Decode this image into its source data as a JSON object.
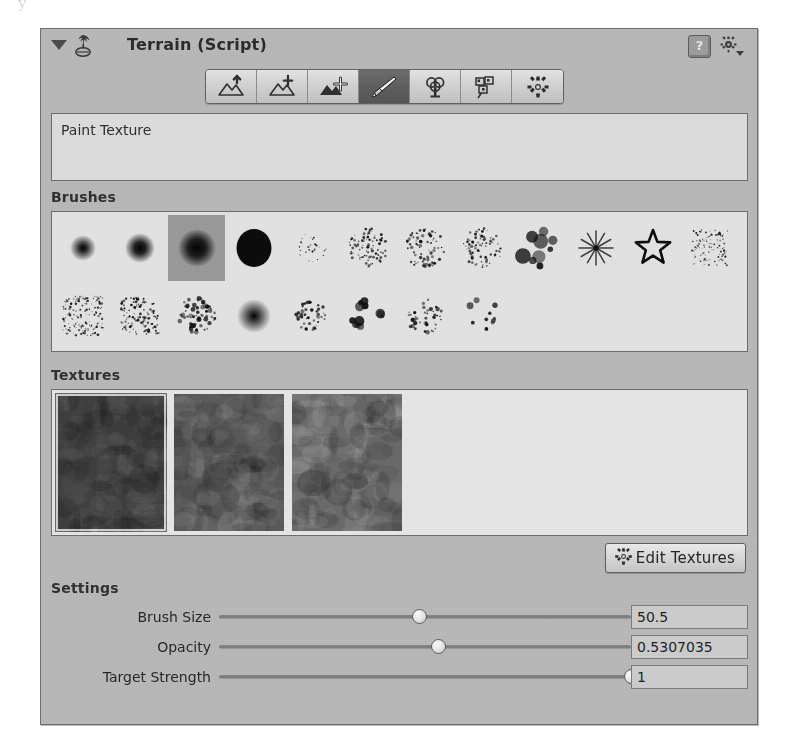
{
  "page_ghost": "y",
  "header": {
    "title": "Terrain (Script)",
    "foldout_icon": "triangle-down-icon",
    "component_icon": "terrain-script-icon",
    "help_icon": "help-book-icon",
    "help_glyph": "?",
    "gear_icon": "gear-dropdown-icon"
  },
  "toolbar": {
    "tools": [
      {
        "name": "raise-lower-terrain",
        "tooltip": "Raise / Lower Terrain",
        "selected": false
      },
      {
        "name": "paint-height",
        "tooltip": "Paint Height",
        "selected": false
      },
      {
        "name": "smooth-height",
        "tooltip": "Smooth Height",
        "selected": false
      },
      {
        "name": "paint-texture",
        "tooltip": "Paint Texture",
        "selected": true
      },
      {
        "name": "place-trees",
        "tooltip": "Place Trees",
        "selected": false
      },
      {
        "name": "paint-details",
        "tooltip": "Paint Details",
        "selected": false
      },
      {
        "name": "terrain-settings",
        "tooltip": "Terrain Settings",
        "selected": false
      }
    ]
  },
  "helpbox": {
    "text": "Paint Texture"
  },
  "sections": {
    "brushes_label": "Brushes",
    "textures_label": "Textures",
    "settings_label": "Settings"
  },
  "brushes": {
    "selected_index": 2,
    "rows": [
      [
        {
          "name": "brush-soft-small",
          "kind": "soft",
          "size": 26,
          "blur": 5
        },
        {
          "name": "brush-soft-medium",
          "kind": "soft",
          "size": 30,
          "blur": 3
        },
        {
          "name": "brush-hard-large",
          "kind": "soft",
          "size": 38,
          "blur": 2
        },
        {
          "name": "brush-hard-solid",
          "kind": "hard",
          "size": 38,
          "blur": 0
        },
        {
          "name": "brush-speckle-fine",
          "kind": "speckle",
          "size": 30,
          "density": 26,
          "dot": 1.6
        },
        {
          "name": "brush-splatter-dense",
          "kind": "speckle",
          "size": 40,
          "density": 90,
          "dot": 2.0
        },
        {
          "name": "brush-cloud-ring",
          "kind": "speckle",
          "size": 40,
          "density": 70,
          "dot": 2.4
        },
        {
          "name": "brush-splatter-rough",
          "kind": "speckle",
          "size": 40,
          "density": 80,
          "dot": 2.2
        },
        {
          "name": "brush-blob-cluster",
          "kind": "cluster",
          "size": 40,
          "density": 9,
          "dot": 11
        },
        {
          "name": "brush-star-burst",
          "kind": "burst",
          "size": 34
        },
        {
          "name": "brush-star-outline",
          "kind": "star",
          "size": 36
        },
        {
          "name": "brush-noise-square",
          "kind": "noise",
          "size": 36,
          "density": 120,
          "dot": 1.4
        }
      ],
      [
        {
          "name": "brush-grain-heavy",
          "kind": "noise",
          "size": 40,
          "density": 150,
          "dot": 1.7
        },
        {
          "name": "brush-streak-vertical",
          "kind": "noise",
          "size": 38,
          "density": 120,
          "dot": 2.0
        },
        {
          "name": "brush-smudge-dark",
          "kind": "speckle",
          "size": 38,
          "density": 60,
          "dot": 3.4
        },
        {
          "name": "brush-blur-blob",
          "kind": "soft",
          "size": 34,
          "blur": 6
        },
        {
          "name": "brush-spatter-small",
          "kind": "speckle",
          "size": 30,
          "density": 45,
          "dot": 2.6
        },
        {
          "name": "brush-dots-large",
          "kind": "cluster",
          "size": 34,
          "density": 12,
          "dot": 7
        },
        {
          "name": "brush-scatter-ring",
          "kind": "speckle",
          "size": 36,
          "density": 40,
          "dot": 3.0
        },
        {
          "name": "brush-sparse-dots",
          "kind": "cluster",
          "size": 34,
          "density": 10,
          "dot": 5
        }
      ]
    ]
  },
  "textures": {
    "selected_index": 0,
    "swatches": [
      {
        "name": "terrain-texture-1",
        "base": "#3e3e3e",
        "selected": true
      },
      {
        "name": "terrain-texture-2",
        "base": "#585858",
        "selected": false
      },
      {
        "name": "terrain-texture-3",
        "base": "#6a6a6a",
        "selected": false
      }
    ]
  },
  "edit_textures": {
    "label": "Edit Textures",
    "icon": "gear-icon"
  },
  "settings": {
    "sliders": [
      {
        "name": "brush-size",
        "label": "Brush Size",
        "value": "50.5",
        "percent": 48.5
      },
      {
        "name": "opacity",
        "label": "Opacity",
        "value": "0.5307035",
        "percent": 53.1
      },
      {
        "name": "target-strength",
        "label": "Target Strength",
        "value": "1",
        "percent": 100
      }
    ]
  },
  "colors": {
    "panel_bg": "#b9b9b9",
    "panel_border": "#6f6f6f",
    "helpbox_bg": "#dedede",
    "brush_panel_bg": "#e4e4e4",
    "selected_tool_bg": "#5d5d5d",
    "selected_brush_bg": "#9a9a9a",
    "field_bg": "#cdcdcd"
  }
}
